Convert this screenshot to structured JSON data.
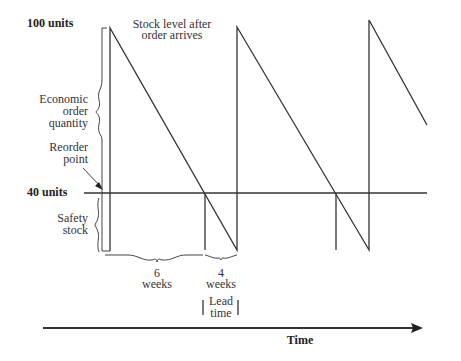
{
  "diagram": {
    "levels": {
      "max_label": "100 units",
      "reorder_label": "40 units",
      "max_value": 100,
      "reorder_value": 40
    },
    "annotations": {
      "stock_after_line1": "Stock level after",
      "stock_after_line2": "order arrives",
      "eoq_line1": "Economic",
      "eoq_line2": "order",
      "eoq_line3": "quantity",
      "reorder_line1": "Reorder",
      "reorder_line2": "point",
      "safety_line1": "Safety",
      "safety_line2": "stock",
      "usage_period_value": "6",
      "usage_period_unit": "weeks",
      "lead_period_value": "4",
      "lead_period_unit": "weeks",
      "lead_line1": "Lead",
      "lead_line2": "time"
    },
    "axis": {
      "x_label": "Time"
    },
    "durations": {
      "to_reorder_point_weeks": 6,
      "lead_time_weeks": 4
    },
    "colors": {
      "line": "#333333",
      "text": "#333333",
      "background": "#ffffff"
    }
  }
}
